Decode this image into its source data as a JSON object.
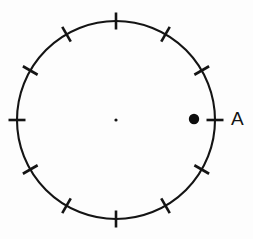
{
  "figure": {
    "type": "geometry-diagram",
    "background_color": "#fdfdfd",
    "stroke_color": "#141414"
  },
  "circle": {
    "name": "circle",
    "center_x": 116,
    "center_y": 120,
    "radius": 99,
    "stroke_width": 2.1
  },
  "center_point": {
    "name": "center-dot",
    "x": 116,
    "y": 120,
    "radius": 1.6,
    "label": ""
  },
  "ticks": {
    "count": 12,
    "spacing_degrees": 30,
    "length": 17,
    "stroke_width": 2.6,
    "angles_degrees": [
      0,
      30,
      60,
      90,
      120,
      150,
      180,
      210,
      240,
      270,
      300,
      330
    ]
  },
  "marked_points": [
    {
      "name": "point-a",
      "label": "A",
      "angle_degrees": 0,
      "marker_x": 194,
      "marker_y": 119,
      "marker_radius": 5.2,
      "label_x": 231,
      "label_y": 120,
      "color": "#0d0d0d"
    }
  ]
}
